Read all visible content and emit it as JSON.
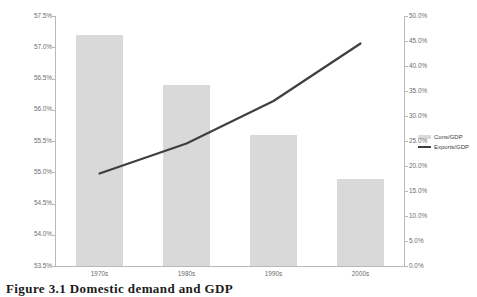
{
  "chart_data": {
    "type": "bar",
    "title": "",
    "categories": [
      "1970s",
      "1980s",
      "1990s",
      "2000s"
    ],
    "series": [
      {
        "name": "Cons/GDP",
        "type": "bar",
        "axis": "left",
        "values": [
          57.2,
          56.4,
          55.6,
          54.9
        ],
        "color": "#d9d9d9"
      },
      {
        "name": "Exports/GDP",
        "type": "line",
        "axis": "right",
        "values": [
          18.5,
          24.5,
          33.0,
          44.5
        ],
        "color": "#3f3f3f"
      }
    ],
    "xlabel": "",
    "ylabel": "",
    "y_left": {
      "min": 53.5,
      "max": 57.5,
      "step": 0.5,
      "ticks": [
        "53.5%",
        "54.0%",
        "54.5%",
        "55.0%",
        "55.5%",
        "56.0%",
        "56.5%",
        "57.0%",
        "57.5%"
      ]
    },
    "y_right": {
      "min": 0.0,
      "max": 50.0,
      "step": 5.0,
      "ticks": [
        "0.0%",
        "5.0%",
        "10.0%",
        "15.0%",
        "20.0%",
        "25.0%",
        "30.0%",
        "35.0%",
        "40.0%",
        "45.0%",
        "50.0%"
      ]
    },
    "grid": false,
    "legend_position": "right"
  },
  "legend": {
    "items": [
      {
        "label": "Cons/GDP"
      },
      {
        "label": "Exports/GDP"
      }
    ]
  },
  "caption": {
    "text": "Figure 3.1   Domestic demand and GDP"
  },
  "colors": {
    "bar": "#d9d9d9",
    "line": "#3f3f3f",
    "axis": "#b9b9b9",
    "tick_text": "#6d6d6d"
  }
}
